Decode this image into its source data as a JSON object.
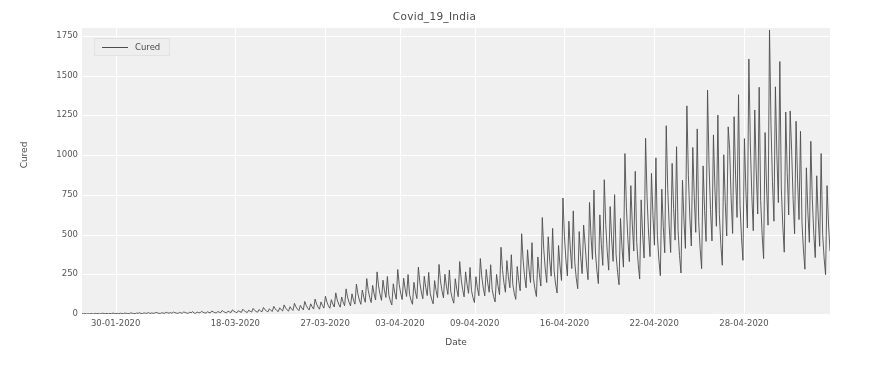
{
  "chart_data": {
    "type": "line",
    "title": "Covid_19_India",
    "xlabel": "Date",
    "ylabel": "Cured",
    "grid": true,
    "legend_position": "upper left",
    "ylim": [
      0,
      1800
    ],
    "yticks": [
      0,
      250,
      500,
      750,
      1000,
      1250,
      1500,
      1750
    ],
    "ytick_labels": [
      "0",
      "250",
      "500",
      "750",
      "1000",
      "1250",
      "1500",
      "1750"
    ],
    "xtick_labels": [
      "30-01-2020",
      "18-03-2020",
      "27-03-2020",
      "03-04-2020",
      "09-04-2020",
      "16-04-2020",
      "22-04-2020",
      "28-04-2020"
    ],
    "xtick_positions": [
      0.045,
      0.205,
      0.325,
      0.425,
      0.525,
      0.645,
      0.765,
      0.885
    ],
    "series": [
      {
        "name": "Cured",
        "color": "#4d4d4d",
        "description": "Cumulative cured count per state-record, ordered by date then state; produces one tall spike per date cycle.",
        "values": [
          2,
          1,
          3,
          0,
          2,
          1,
          3,
          2,
          1,
          4,
          2,
          3,
          1,
          2,
          5,
          3,
          2,
          4,
          1,
          3,
          2,
          6,
          3,
          2,
          4,
          1,
          5,
          3,
          2,
          6,
          4,
          3,
          2,
          7,
          5,
          3,
          2,
          6,
          4,
          8,
          3,
          2,
          7,
          5,
          4,
          9,
          3,
          6,
          5,
          4,
          10,
          7,
          5,
          3,
          8,
          6,
          4,
          11,
          7,
          5,
          9,
          4,
          12,
          8,
          6,
          3,
          10,
          7,
          5,
          13,
          9,
          6,
          4,
          11,
          8,
          15,
          6,
          4,
          12,
          9,
          7,
          17,
          11,
          8,
          5,
          14,
          10,
          7,
          19,
          13,
          9,
          6,
          16,
          11,
          8,
          22,
          15,
          10,
          7,
          18,
          13,
          9,
          26,
          17,
          12,
          8,
          21,
          15,
          10,
          30,
          20,
          14,
          9,
          24,
          17,
          12,
          35,
          23,
          16,
          11,
          28,
          20,
          14,
          41,
          27,
          19,
          13,
          33,
          23,
          16,
          48,
          32,
          22,
          15,
          39,
          27,
          19,
          57,
          38,
          26,
          18,
          46,
          32,
          22,
          67,
          45,
          31,
          21,
          54,
          38,
          26,
          79,
          53,
          37,
          25,
          64,
          45,
          31,
          94,
          63,
          44,
          30,
          76,
          53,
          37,
          112,
          75,
          52,
          36,
          90,
          63,
          44,
          133,
          89,
          62,
          43,
          107,
          75,
          52,
          158,
          106,
          74,
          51,
          127,
          89,
          62,
          188,
          126,
          88,
          61,
          151,
          106,
          74,
          223,
          149,
          104,
          72,
          180,
          126,
          88,
          265,
          177,
          124,
          86,
          213,
          149,
          104,
          236,
          118,
          82,
          57,
          190,
          133,
          93,
          280,
          187,
          131,
          91,
          225,
          158,
          110,
          248,
          124,
          87,
          61,
          199,
          139,
          97,
          295,
          197,
          138,
          96,
          237,
          166,
          116,
          262,
          131,
          92,
          64,
          210,
          147,
          103,
          312,
          208,
          146,
          102,
          250,
          175,
          123,
          277,
          139,
          97,
          68,
          222,
          156,
          109,
          330,
          220,
          154,
          108,
          265,
          185,
          130,
          293,
          147,
          103,
          72,
          235,
          165,
          115,
          349,
          233,
          163,
          114,
          280,
          196,
          137,
          310,
          155,
          109,
          76,
          249,
          174,
          122,
          420,
          280,
          196,
          137,
          336,
          235,
          165,
          373,
          187,
          131,
          92,
          299,
          209,
          146,
          505,
          337,
          236,
          165,
          404,
          283,
          198,
          449,
          224,
          157,
          110,
          359,
          252,
          176,
          607,
          405,
          283,
          198,
          486,
          340,
          238,
          539,
          270,
          189,
          132,
          431,
          302,
          211,
          730,
          487,
          341,
          239,
          584,
          409,
          286,
          649,
          324,
          227,
          159,
          519,
          363,
          254,
          560,
          440,
          308,
          216,
          702,
          491,
          344,
          780,
          390,
          273,
          191,
          624,
          437,
          306,
          845,
          563,
          394,
          276,
          676,
          473,
          331,
          751,
          375,
          263,
          184,
          601,
          421,
          295,
          1010,
          673,
          471,
          330,
          808,
          566,
          396,
          898,
          449,
          314,
          220,
          718,
          503,
          352,
          1106,
          737,
          516,
          361,
          885,
          619,
          433,
          983,
          492,
          344,
          241,
          786,
          550,
          385,
          1185,
          790,
          553,
          387,
          948,
          664,
          465,
          1053,
          527,
          369,
          258,
          842,
          590,
          413,
          1310,
          873,
          611,
          428,
          1048,
          734,
          514,
          1165,
          582,
          408,
          285,
          932,
          652,
          457,
          1409,
          939,
          657,
          460,
          1127,
          789,
          552,
          1252,
          626,
          438,
          307,
          1002,
          701,
          491,
          1178,
          1035,
          724,
          507,
          1242,
          869,
          608,
          1380,
          690,
          483,
          338,
          1104,
          773,
          541,
          1605,
          1070,
          749,
          524,
          1284,
          899,
          629,
          1427,
          713,
          499,
          349,
          1142,
          799,
          559,
          1788,
          1192,
          834,
          584,
          1430,
          1001,
          701,
          1589,
          794,
          556,
          389,
          1271,
          890,
          623,
          1278,
          1030,
          721,
          505,
          1213,
          849,
          594,
          1150,
          575,
          403,
          282,
          920,
          644,
          451,
          1087,
          725,
          507,
          355,
          870,
          609,
          426,
          1010,
          505,
          353,
          247,
          808,
          566,
          396
        ]
      }
    ]
  },
  "legend": {
    "label": "Cured"
  }
}
